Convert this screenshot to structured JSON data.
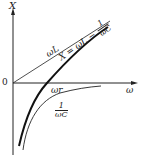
{
  "diagram": {
    "y_axis_label": "X",
    "x_axis_label": "ω",
    "origin_label": "0",
    "resonance_label": "ωr",
    "inductive_label": "ωL",
    "reactance_formula": {
      "prefix": "X = ωL −",
      "num": "1",
      "den": "ωC"
    },
    "capacitive_label": {
      "num": "1",
      "den": "ωC"
    }
  }
}
